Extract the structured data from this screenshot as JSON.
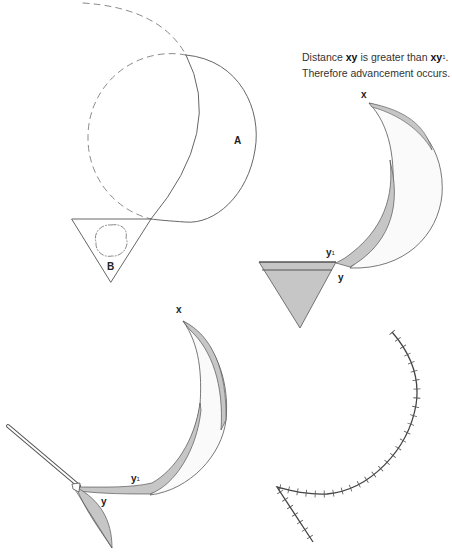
{
  "caption": {
    "line1_prefix": "Distance ",
    "line1_bold1": "xy",
    "line1_mid": " is greater than ",
    "line1_bold2": "xy",
    "line1_sup": "1",
    "line1_suffix": ".",
    "line2": "Therefore advancement occurs."
  },
  "figure1": {
    "label_crescent": "A",
    "label_triangle": "B"
  },
  "figure2": {
    "label_x": "x",
    "label_y1": "y",
    "label_y1_sup": "1",
    "label_y": "y"
  },
  "figure3": {
    "label_x": "x",
    "label_y1": "y",
    "label_y1_sup": "1",
    "label_y": "y"
  },
  "colors": {
    "line": "#555555",
    "dash": "#888888",
    "fill_gray": "#c6c6c6",
    "fill_light": "#f7f7f7"
  }
}
